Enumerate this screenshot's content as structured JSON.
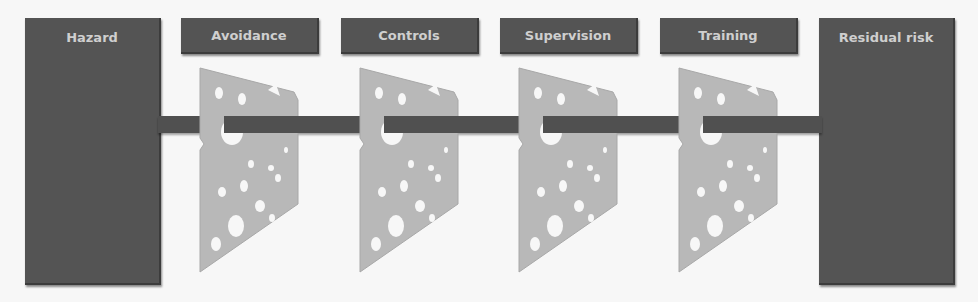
{
  "diagram": {
    "type": "swiss-cheese-model",
    "start": {
      "label": "Hazard"
    },
    "end": {
      "label": "Residual risk"
    },
    "layers": [
      {
        "label": "Avoidance"
      },
      {
        "label": "Controls"
      },
      {
        "label": "Supervision"
      },
      {
        "label": "Training"
      }
    ],
    "colors": {
      "box": "#545454",
      "label_text": "#cfcfcf",
      "slice": "#b8b8b8",
      "rod": "#505050",
      "background": "#f7f7f7"
    }
  }
}
